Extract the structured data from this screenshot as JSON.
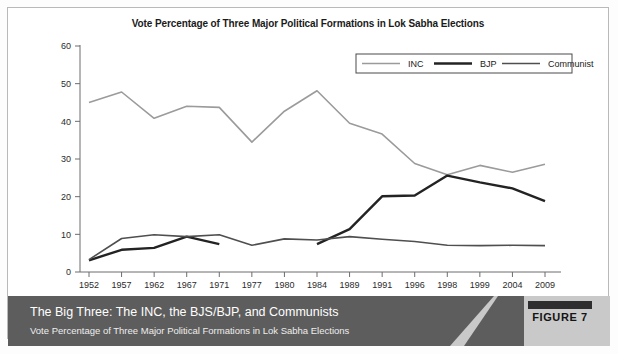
{
  "figure": {
    "caption_title": "The Big Three: The INC, the BJS/BJP, and Communists",
    "caption_subtitle": "Vote Percentage of Three Major Political Formations in Lok Sabha Elections",
    "badge_label": "FIGURE 7"
  },
  "chart_data": {
    "type": "line",
    "title": "Vote Percentage of Three Major Political Formations in Lok Sabha Elections",
    "xlabel": "",
    "ylabel": "",
    "categories": [
      "1952",
      "1957",
      "1962",
      "1967",
      "1971",
      "1977",
      "1980",
      "1984",
      "1989",
      "1991",
      "1996",
      "1998",
      "1999",
      "2004",
      "2009"
    ],
    "ylim": [
      0,
      60
    ],
    "yticks": [
      0,
      10,
      20,
      30,
      40,
      50,
      60
    ],
    "grid": false,
    "legend_position": "top-right",
    "series": [
      {
        "name": "INC",
        "color": "#9b9b9b",
        "width": 1.6,
        "values": [
          45.0,
          47.8,
          40.8,
          44.0,
          43.7,
          34.5,
          42.7,
          48.1,
          39.5,
          36.6,
          28.8,
          25.8,
          28.3,
          26.5,
          28.6
        ]
      },
      {
        "name": "BJP",
        "color": "#232323",
        "width": 2.4,
        "values": [
          3.1,
          5.9,
          6.4,
          9.4,
          7.4,
          null,
          null,
          7.4,
          11.4,
          20.1,
          20.3,
          25.6,
          23.8,
          22.2,
          18.8
        ]
      },
      {
        "name": "Communist",
        "color": "#4f4f4f",
        "width": 1.6,
        "values": [
          3.3,
          8.9,
          9.9,
          9.4,
          9.9,
          7.1,
          8.8,
          8.5,
          9.4,
          8.7,
          8.1,
          7.1,
          7.0,
          7.1,
          7.0
        ]
      }
    ]
  }
}
